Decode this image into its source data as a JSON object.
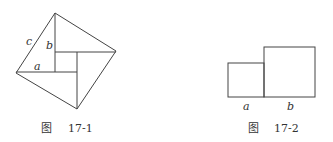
{
  "figures": [
    {
      "id": "fig-17-1",
      "caption_prefix": "图",
      "caption_number": "17-1",
      "labels": {
        "c": "c",
        "b": "b",
        "a": "a"
      }
    },
    {
      "id": "fig-17-2",
      "caption_prefix": "图",
      "caption_number": "17-2",
      "labels": {
        "a": "a",
        "b": "b"
      }
    }
  ],
  "colors": {
    "stroke": "#444444",
    "text": "#333333",
    "background": "#ffffff"
  }
}
